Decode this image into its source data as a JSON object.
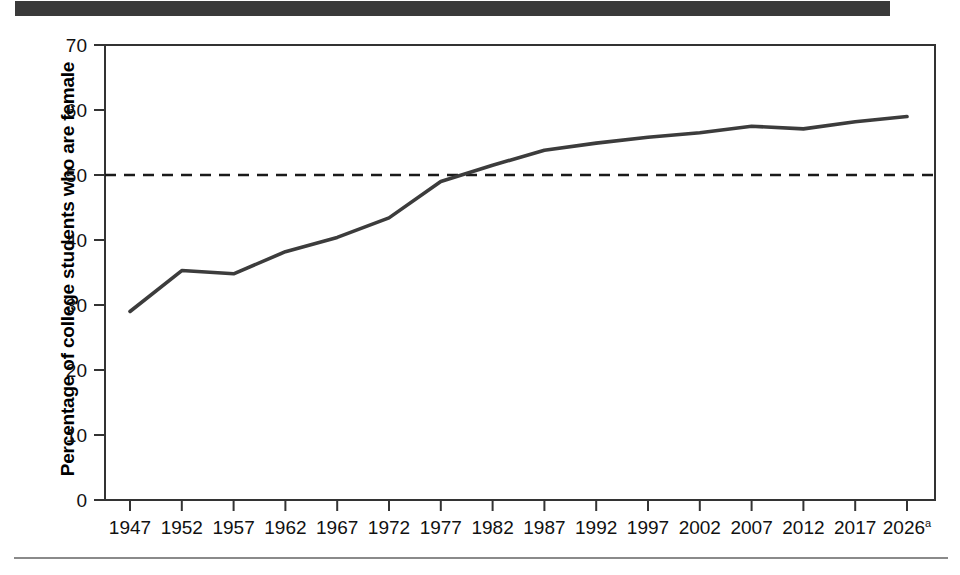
{
  "figure": {
    "header_band_color": "#3a3a3a",
    "background_color": "#ffffff",
    "line_color": "#3c3c3c",
    "axis_color": "#333333",
    "reference_line_color": "#1a1a1a"
  },
  "chart_data": {
    "type": "line",
    "title": "",
    "xlabel": "",
    "ylabel": "Percentage of college students who are female",
    "categories": [
      "1947",
      "1952",
      "1957",
      "1962",
      "1967",
      "1972",
      "1977",
      "1982",
      "1987",
      "1992",
      "1997",
      "2002",
      "2007",
      "2012",
      "2017",
      "2026"
    ],
    "category_superscripts": [
      "",
      "",
      "",
      "",
      "",
      "",
      "",
      "",
      "",
      "",
      "",
      "",
      "",
      "",
      "",
      "a"
    ],
    "values": [
      29.0,
      35.3,
      34.8,
      38.2,
      40.4,
      43.4,
      49.0,
      51.5,
      53.8,
      54.9,
      55.8,
      56.5,
      57.5,
      57.1,
      58.2,
      59.0
    ],
    "ylim": [
      0,
      70
    ],
    "yticks": [
      0,
      10,
      20,
      30,
      40,
      50,
      60,
      70
    ],
    "ytick_labels": [
      "0",
      "10",
      "20",
      "30",
      "40",
      "50",
      "60",
      "70"
    ],
    "grid": false,
    "legend": "none",
    "annotations": [
      {
        "name": "fifty-percent-reference-line",
        "type": "horizontal-dashed-line",
        "y": 50,
        "label": ""
      }
    ]
  }
}
